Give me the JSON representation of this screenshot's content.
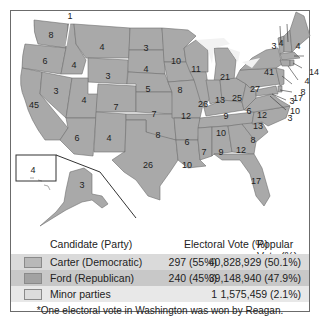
{
  "map": {
    "labels": {
      "wa": "8",
      "wa_note": "1",
      "or": "6",
      "ca": "45",
      "id": "4",
      "nv": "3",
      "mt": "4",
      "wy": "3",
      "ut": "4",
      "az": "6",
      "co": "7",
      "nm": "4",
      "nd": "3",
      "sd": "4",
      "ne": "5",
      "ks": "7",
      "ok": "8",
      "tx": "26",
      "mn": "10",
      "ia": "8",
      "mo": "12",
      "ar": "6",
      "la": "10",
      "wi": "11",
      "il": "26",
      "mi": "21",
      "in": "13",
      "oh": "25",
      "ky": "9",
      "tn": "10",
      "ms": "7",
      "al": "9",
      "ga": "12",
      "fl": "17",
      "sc": "8",
      "nc": "13",
      "va": "12",
      "wv": "6",
      "pa": "27",
      "ny": "41",
      "vt": "3",
      "nh": "4",
      "me": "4",
      "ma": "14",
      "ri": "4",
      "ct": "8",
      "nj": "17",
      "de": "3",
      "md": "10",
      "dc": "3",
      "hi": "4",
      "ak": "3"
    },
    "colors": {
      "state": "#a9a9a9",
      "border": "#6e6e6e",
      "lakes": "#f2f2f2"
    }
  },
  "legend": {
    "header": {
      "candidate": "Candidate (Party)",
      "electoral": "Electoral Vote (%)",
      "popular": "Popular Vote (%)"
    },
    "rows": [
      {
        "candidate": "Carter (Democratic)",
        "electoral": "297 (55%)",
        "popular": "40,828,929 (50.1%)"
      },
      {
        "candidate": "Ford (Republican)",
        "electoral": "240 (45%)",
        "popular": "39,148,940 (47.9%)"
      },
      {
        "candidate": "Minor parties",
        "electoral": "1",
        "popular": "1,575,459 (2.1%)"
      }
    ],
    "note": "*One electoral vote in Washington was won by Reagan."
  }
}
